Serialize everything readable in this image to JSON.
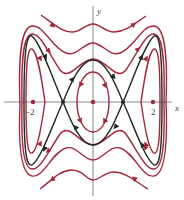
{
  "figure": {
    "type": "phase-portrait",
    "axes": {
      "x_label": "x",
      "y_label": "y",
      "tick_labels": [
        "-2",
        "2"
      ],
      "tick_label_display": [
        "−2",
        "2"
      ]
    },
    "equilibria": {
      "centers": [
        {
          "x": -2,
          "y": 0
        },
        {
          "x": 0,
          "y": 0
        },
        {
          "x": 2,
          "y": 0
        }
      ],
      "saddles": [
        {
          "x": -1,
          "y": 0
        },
        {
          "x": 1,
          "y": 0
        }
      ]
    },
    "colors": {
      "orbit": "#a3283a",
      "separatrix": "#1f2a24",
      "axis": "#6b6b6b",
      "equilibrium_center": "#a3283a",
      "equilibrium_saddle": "#1f2a24"
    },
    "curves": [
      {
        "name": "inner-loop-center",
        "color": "red"
      },
      {
        "name": "outer-loop-left",
        "color": "red"
      },
      {
        "name": "outer-loop-right",
        "color": "red"
      },
      {
        "name": "separatrix",
        "color": "black"
      },
      {
        "name": "outer-orbit-1",
        "color": "red"
      },
      {
        "name": "outer-orbit-2",
        "color": "red"
      },
      {
        "name": "top-wave",
        "color": "red"
      },
      {
        "name": "bottom-wave",
        "color": "red"
      }
    ]
  }
}
